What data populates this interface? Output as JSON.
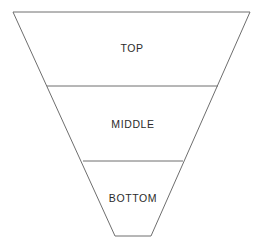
{
  "diagram": {
    "type": "funnel",
    "title": "",
    "background_color": "#ffffff",
    "stroke_color": "#6e6e6e",
    "text_color": "#2b2b2b",
    "orientation": "inverted-triangle-top-to-bottom",
    "segments": [
      {
        "id": "top",
        "label": "TOP",
        "order": 1,
        "top_width_px": 237,
        "bottom_width_px": 171,
        "top_y_px": 12,
        "bottom_y_px": 86,
        "height_px": 74
      },
      {
        "id": "middle",
        "label": "MIDDLE",
        "order": 2,
        "top_width_px": 171,
        "bottom_width_px": 100,
        "top_y_px": 86,
        "bottom_y_px": 161,
        "height_px": 75
      },
      {
        "id": "bottom",
        "label": "BOTTOM",
        "order": 3,
        "top_width_px": 100,
        "bottom_width_px": 36,
        "top_y_px": 161,
        "bottom_y_px": 236,
        "height_px": 75
      }
    ],
    "outline_points": "13,12 250,12 151,236 115,236",
    "dividers": [
      {
        "id": "divider-top-middle",
        "x1": 47,
        "y1": 86,
        "x2": 218,
        "y2": 86
      },
      {
        "id": "divider-middle-bottom",
        "x1": 83,
        "y1": 161,
        "x2": 183,
        "y2": 161
      }
    ]
  },
  "chart_data": {
    "type": "funnel",
    "title": "",
    "categories": [
      "TOP",
      "MIDDLE",
      "BOTTOM"
    ],
    "values": [
      237,
      171,
      100
    ],
    "unit": "relative width (px)",
    "xlabel": "",
    "ylabel": "",
    "legend": [],
    "grid": false
  }
}
